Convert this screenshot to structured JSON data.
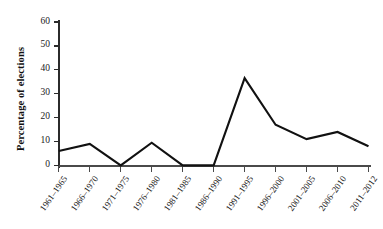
{
  "chart_data": {
    "type": "line",
    "title": "",
    "xlabel": "",
    "ylabel": "Percentage of elections",
    "categories": [
      "1961–1965",
      "1966–1970",
      "1971–1975",
      "1976–1980",
      "1981–1985",
      "1986–1990",
      "1991–1995",
      "1996–2000",
      "2001–2005",
      "2006–2010",
      "2011–2012"
    ],
    "values": [
      6,
      9,
      0,
      9.5,
      0,
      0,
      36.5,
      17,
      11,
      14,
      8
    ],
    "ylim": [
      0,
      60
    ],
    "yticks": [
      0,
      10,
      20,
      30,
      40,
      50,
      60
    ],
    "ytick_labels": [
      "0",
      "10",
      "20",
      "30",
      "40",
      "50",
      "60"
    ],
    "grid": false,
    "legend": false,
    "series_color": "#111111",
    "axis_color": "#4a4a4a",
    "background": "#ffffff"
  }
}
